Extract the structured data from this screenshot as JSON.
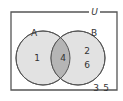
{
  "diagram": {
    "type": "venn",
    "universal_label": "U",
    "sets": [
      {
        "name": "A",
        "label": "A"
      },
      {
        "name": "B",
        "label": "B"
      }
    ],
    "regions": {
      "a_only": [
        "1"
      ],
      "a_and_b": [
        "4"
      ],
      "b_only": [
        "2",
        "6"
      ],
      "outside": [
        "3",
        "5"
      ]
    },
    "labels": {
      "u": "U",
      "a": "A",
      "b": "B",
      "a_only_1": "1",
      "intersection_4": "4",
      "b_only_2": "2",
      "b_only_6": "6",
      "outside_3": "3",
      "outside_5": "5"
    },
    "colors": {
      "border": "#555555",
      "circle_fill": "#e2e2e2",
      "intersection_fill": "#b5b5b5",
      "background": "#ffffff"
    }
  }
}
